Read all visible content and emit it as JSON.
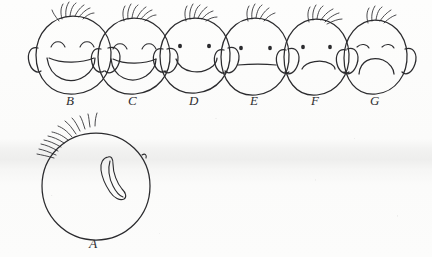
{
  "document": {
    "kind": "hand-drawn-face-rating-scale",
    "medium": "pencil-on-scanned-paper",
    "ink_color": "#2b2b2e",
    "paper_color": "#fbfbfa"
  },
  "top_row": {
    "description": "Row of six hand-drawn cartoon heads with hair tufts and ears, expressions ranging from very happy to very sad",
    "faces": [
      {
        "label": "B",
        "expression": "very-happy",
        "eyes": "closed-arched",
        "mouth": "wide-open-smile",
        "cx": 73,
        "cy": 55,
        "rx": 37,
        "ry": 40,
        "label_x": 66,
        "label_y": 105
      },
      {
        "label": "C",
        "expression": "happy",
        "eyes": "closed-arched",
        "mouth": "open-smile",
        "cx": 134,
        "cy": 56,
        "rx": 35,
        "ry": 38,
        "label_x": 128,
        "label_y": 105
      },
      {
        "label": "D",
        "expression": "slightly-happy",
        "eyes": "dots",
        "mouth": "curved-smile",
        "cx": 195,
        "cy": 55,
        "rx": 34,
        "ry": 38,
        "label_x": 189,
        "label_y": 105
      },
      {
        "label": "E",
        "expression": "neutral",
        "eyes": "dots",
        "mouth": "straight-line",
        "cx": 255,
        "cy": 56,
        "rx": 33,
        "ry": 39,
        "label_x": 250,
        "label_y": 105
      },
      {
        "label": "F",
        "expression": "slightly-sad",
        "eyes": "dots",
        "mouth": "frown",
        "cx": 316,
        "cy": 56,
        "rx": 32,
        "ry": 38,
        "label_x": 311,
        "label_y": 105
      },
      {
        "label": "G",
        "expression": "very-sad",
        "eyes": "downturned-arcs",
        "mouth": "deep-frown",
        "cx": 375,
        "cy": 56,
        "rx": 31,
        "ry": 37,
        "label_x": 370,
        "label_y": 105
      }
    ]
  },
  "bottom_figure": {
    "label": "A",
    "description": "Large blank circular head with feathery hair strokes on the upper-left and a single curved nose-like shape at the centre; no eyes and no mouth drawn",
    "expression": "blank-featureless",
    "cx": 96,
    "cy": 187,
    "r": 54,
    "label_x": 89,
    "label_y": 248
  },
  "letters": [
    "A",
    "B",
    "C",
    "D",
    "E",
    "F",
    "G"
  ]
}
